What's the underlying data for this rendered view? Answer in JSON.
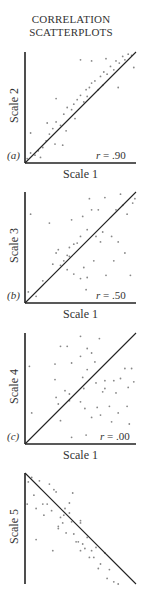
{
  "title": {
    "line1": "CORRELATION",
    "line2": "SCATTERPLOTS"
  },
  "colors": {
    "axis": "#222222",
    "line": "#222222",
    "points": "#888888"
  },
  "chart_data": [
    {
      "type": "scatter",
      "panel": "(a)",
      "xlabel": "Scale 1",
      "ylabel": "Scale 2",
      "annotation": "r = .90",
      "r": 0.9,
      "fit_line": {
        "from": [
          0,
          0
        ],
        "to": [
          1,
          1
        ]
      },
      "xlim": [
        0,
        1
      ],
      "ylim": [
        0,
        1
      ],
      "grid": false,
      "points": [
        [
          0.02,
          0.04
        ],
        [
          0.05,
          0.09
        ],
        [
          0.09,
          0.07
        ],
        [
          0.12,
          0.11
        ],
        [
          0.14,
          0.05
        ],
        [
          0.16,
          0.14
        ],
        [
          0.19,
          0.2
        ],
        [
          0.22,
          0.26
        ],
        [
          0.25,
          0.31
        ],
        [
          0.27,
          0.17
        ],
        [
          0.28,
          0.37
        ],
        [
          0.32,
          0.34
        ],
        [
          0.35,
          0.44
        ],
        [
          0.37,
          0.29
        ],
        [
          0.38,
          0.5
        ],
        [
          0.42,
          0.48
        ],
        [
          0.44,
          0.53
        ],
        [
          0.47,
          0.57
        ],
        [
          0.5,
          0.61
        ],
        [
          0.53,
          0.55
        ],
        [
          0.55,
          0.66
        ],
        [
          0.58,
          0.68
        ],
        [
          0.6,
          0.72
        ],
        [
          0.63,
          0.74
        ],
        [
          0.66,
          0.66
        ],
        [
          0.68,
          0.78
        ],
        [
          0.71,
          0.82
        ],
        [
          0.74,
          0.8
        ],
        [
          0.77,
          0.87
        ],
        [
          0.8,
          0.84
        ],
        [
          0.82,
          0.92
        ],
        [
          0.85,
          0.9
        ],
        [
          0.88,
          0.96
        ],
        [
          0.9,
          0.93
        ],
        [
          0.93,
          0.98
        ],
        [
          0.96,
          0.97
        ],
        [
          0.98,
          0.86
        ],
        [
          0.6,
          0.92
        ],
        [
          0.73,
          0.94
        ],
        [
          0.5,
          0.93
        ],
        [
          0.34,
          0.16
        ],
        [
          0.2,
          0.36
        ],
        [
          0.05,
          0.27
        ],
        [
          0.28,
          0.58
        ],
        [
          0.84,
          0.68
        ],
        [
          0.7,
          0.7
        ],
        [
          0.56,
          0.6
        ],
        [
          0.45,
          0.4
        ]
      ]
    },
    {
      "type": "scatter",
      "panel": "(b)",
      "xlabel": "Scale 1",
      "ylabel": "Scale 3",
      "annotation": "r = .50",
      "r": 0.5,
      "fit_line": {
        "from": [
          0,
          0
        ],
        "to": [
          1,
          1
        ]
      },
      "xlim": [
        0,
        1
      ],
      "ylim": [
        0,
        1
      ],
      "grid": false,
      "points": [
        [
          0.03,
          0.1
        ],
        [
          0.05,
          0.8
        ],
        [
          0.1,
          0.06
        ],
        [
          0.16,
          0.2
        ],
        [
          0.22,
          0.72
        ],
        [
          0.25,
          0.35
        ],
        [
          0.28,
          0.45
        ],
        [
          0.3,
          0.48
        ],
        [
          0.32,
          0.34
        ],
        [
          0.35,
          0.38
        ],
        [
          0.38,
          0.43
        ],
        [
          0.4,
          0.5
        ],
        [
          0.42,
          0.75
        ],
        [
          0.44,
          0.53
        ],
        [
          0.44,
          0.26
        ],
        [
          0.47,
          0.54
        ],
        [
          0.5,
          0.6
        ],
        [
          0.5,
          0.22
        ],
        [
          0.52,
          0.78
        ],
        [
          0.53,
          0.32
        ],
        [
          0.55,
          0.12
        ],
        [
          0.56,
          0.66
        ],
        [
          0.58,
          0.94
        ],
        [
          0.6,
          0.84
        ],
        [
          0.62,
          0.38
        ],
        [
          0.64,
          0.6
        ],
        [
          0.66,
          0.84
        ],
        [
          0.68,
          0.55
        ],
        [
          0.7,
          0.64
        ],
        [
          0.72,
          0.95
        ],
        [
          0.73,
          0.25
        ],
        [
          0.78,
          0.6
        ],
        [
          0.8,
          0.38
        ],
        [
          0.82,
          0.84
        ],
        [
          0.84,
          0.55
        ],
        [
          0.86,
          0.98
        ],
        [
          0.88,
          0.88
        ],
        [
          0.9,
          0.45
        ],
        [
          0.92,
          0.8
        ],
        [
          0.95,
          0.25
        ],
        [
          0.97,
          0.9
        ],
        [
          0.99,
          0.94
        ],
        [
          0.56,
          0.23
        ],
        [
          0.4,
          0.42
        ],
        [
          0.38,
          0.3
        ]
      ]
    },
    {
      "type": "scatter",
      "panel": "(c)",
      "xlabel": "Scale 1",
      "ylabel": "Scale 4",
      "annotation": "r = .00",
      "r": 0.0,
      "fit_line": {
        "from": [
          0,
          0
        ],
        "to": [
          1,
          1
        ]
      },
      "xlim": [
        0,
        1
      ],
      "ylim": [
        0,
        1
      ],
      "grid": false,
      "points": [
        [
          0.04,
          0.7
        ],
        [
          0.06,
          0.28
        ],
        [
          0.27,
          0.72
        ],
        [
          0.27,
          0.58
        ],
        [
          0.28,
          0.42
        ],
        [
          0.3,
          0.36
        ],
        [
          0.32,
          0.88
        ],
        [
          0.32,
          0.21
        ],
        [
          0.36,
          0.48
        ],
        [
          0.38,
          0.88
        ],
        [
          0.4,
          0.45
        ],
        [
          0.4,
          0.39
        ],
        [
          0.42,
          0.73
        ],
        [
          0.42,
          0.06
        ],
        [
          0.5,
          0.97
        ],
        [
          0.5,
          0.79
        ],
        [
          0.5,
          0.38
        ],
        [
          0.52,
          0.6
        ],
        [
          0.53,
          0.5
        ],
        [
          0.54,
          0.32
        ],
        [
          0.55,
          0.08
        ],
        [
          0.56,
          0.86
        ],
        [
          0.56,
          0.67
        ],
        [
          0.6,
          0.82
        ],
        [
          0.6,
          0.24
        ],
        [
          0.63,
          0.74
        ],
        [
          0.64,
          0.55
        ],
        [
          0.65,
          0.33
        ],
        [
          0.67,
          0.95
        ],
        [
          0.68,
          0.26
        ],
        [
          0.7,
          0.47
        ],
        [
          0.72,
          0.57
        ],
        [
          0.72,
          0.5
        ],
        [
          0.76,
          0.34
        ],
        [
          0.78,
          0.2
        ],
        [
          0.8,
          0.57
        ],
        [
          0.82,
          0.46
        ],
        [
          0.84,
          0.28
        ],
        [
          0.86,
          0.59
        ],
        [
          0.9,
          0.68
        ],
        [
          0.92,
          0.34
        ],
        [
          0.93,
          0.51
        ],
        [
          0.94,
          0.18
        ],
        [
          0.96,
          0.68
        ],
        [
          0.98,
          0.56
        ]
      ]
    },
    {
      "type": "scatter",
      "panel": "(d)",
      "xlabel": "",
      "ylabel": "Scale 5",
      "annotation": "",
      "fit_line": {
        "from": [
          0,
          1
        ],
        "to": [
          1,
          0
        ]
      },
      "xlim": [
        0,
        1
      ],
      "ylim": [
        0,
        1
      ],
      "grid": false,
      "partially_visible": true,
      "points": [
        [
          0.02,
          0.72
        ],
        [
          0.03,
          0.92
        ],
        [
          0.06,
          0.96
        ],
        [
          0.08,
          0.8
        ],
        [
          0.1,
          0.68
        ],
        [
          0.1,
          0.4
        ],
        [
          0.13,
          0.93
        ],
        [
          0.16,
          0.72
        ],
        [
          0.17,
          0.62
        ],
        [
          0.2,
          0.72
        ],
        [
          0.22,
          0.9
        ],
        [
          0.24,
          0.66
        ],
        [
          0.25,
          0.3
        ],
        [
          0.26,
          0.85
        ],
        [
          0.28,
          0.83
        ],
        [
          0.3,
          0.5
        ],
        [
          0.3,
          0.52
        ],
        [
          0.32,
          0.6
        ],
        [
          0.34,
          0.55
        ],
        [
          0.35,
          0.62
        ],
        [
          0.36,
          0.68
        ],
        [
          0.37,
          0.46
        ],
        [
          0.4,
          0.73
        ],
        [
          0.4,
          0.64
        ],
        [
          0.42,
          0.56
        ],
        [
          0.43,
          0.82
        ],
        [
          0.44,
          0.45
        ],
        [
          0.46,
          0.38
        ],
        [
          0.48,
          0.38
        ],
        [
          0.5,
          0.55
        ],
        [
          0.5,
          0.3
        ],
        [
          0.52,
          0.36
        ],
        [
          0.54,
          0.32
        ],
        [
          0.56,
          0.42
        ],
        [
          0.58,
          0.24
        ],
        [
          0.6,
          0.3
        ],
        [
          0.62,
          0.24
        ],
        [
          0.64,
          0.33
        ],
        [
          0.66,
          0.14
        ],
        [
          0.68,
          0.18
        ],
        [
          0.72,
          0.28
        ],
        [
          0.74,
          0.05
        ],
        [
          0.76,
          0.13
        ],
        [
          0.8,
          0.02
        ],
        [
          0.84,
          0.0
        ],
        [
          0.5,
          0.57
        ]
      ]
    }
  ],
  "panels": [
    {
      "label": "(a)",
      "xlabel": "Scale 1",
      "ylabel": "Scale 2",
      "r_symbol": "r",
      "r_text": " = .90"
    },
    {
      "label": "(b)",
      "xlabel": "Scale 1",
      "ylabel": "Scale 3",
      "r_symbol": "r",
      "r_text": " = .50"
    },
    {
      "label": "(c)",
      "xlabel": "Scale 1",
      "ylabel": "Scale 4",
      "r_symbol": "r",
      "r_text": " = .00"
    },
    {
      "label": "",
      "xlabel": "",
      "ylabel": "Scale 5",
      "r_symbol": "",
      "r_text": ""
    }
  ]
}
